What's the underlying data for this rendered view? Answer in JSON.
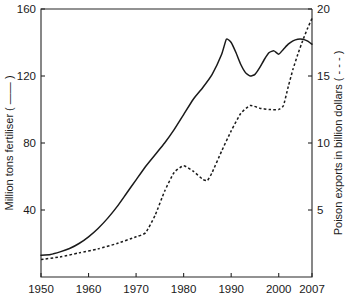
{
  "chart_data": {
    "type": "line",
    "title": "",
    "subtitle": "",
    "xlabel": "",
    "ylabel": "Million tons fertiliser ( —— )",
    "y2label": "Poison exports in billion dollars ( - - - )",
    "xlim": [
      1950,
      2007
    ],
    "ylim": [
      0,
      160
    ],
    "y2lim": [
      0,
      20
    ],
    "grid": false,
    "legend_position": "none",
    "xticks": [
      1950,
      1960,
      1970,
      1980,
      1990,
      2000,
      2007
    ],
    "xtick_labels": [
      "1950",
      "1960",
      "1970",
      "1980",
      "1990",
      "2000",
      "2007"
    ],
    "yticks": [
      40,
      80,
      120,
      160
    ],
    "ytick_labels": [
      "40",
      "80",
      "120",
      "160"
    ],
    "y2ticks": [
      5,
      10,
      15,
      20
    ],
    "y2tick_labels": [
      "5",
      "10",
      "15",
      "20"
    ],
    "series": [
      {
        "name": "Million tons fertiliser",
        "axis": "left",
        "style": "solid",
        "color": "#1a1a1a",
        "x": [
          1950,
          1952,
          1954,
          1956,
          1958,
          1960,
          1962,
          1964,
          1966,
          1968,
          1970,
          1972,
          1974,
          1976,
          1978,
          1980,
          1982,
          1984,
          1986,
          1988,
          1989,
          1990,
          1991,
          1992,
          1993,
          1994,
          1995,
          1996,
          1997,
          1998,
          1999,
          2000,
          2001,
          2002,
          2003,
          2004,
          2005,
          2006,
          2007
        ],
        "values": [
          13,
          13.5,
          15,
          17,
          20,
          24,
          29,
          35,
          42,
          50,
          58,
          66,
          73,
          80,
          88,
          97,
          106,
          113,
          121,
          133,
          142,
          140,
          134,
          127,
          122,
          120,
          121,
          125,
          130,
          134,
          135,
          133,
          136,
          139,
          141,
          142,
          142,
          141,
          139
        ]
      },
      {
        "name": "Poison exports in billion dollars",
        "axis": "right",
        "style": "dashed",
        "color": "#1a1a1a",
        "x": [
          1950,
          1954,
          1958,
          1962,
          1966,
          1970,
          1972,
          1974,
          1976,
          1978,
          1980,
          1982,
          1984,
          1985,
          1986,
          1988,
          1990,
          1992,
          1994,
          1996,
          1998,
          2000,
          2001,
          2002,
          2003,
          2004,
          2005,
          2006,
          2007
        ],
        "values": [
          1.3,
          1.5,
          1.8,
          2.1,
          2.5,
          3.0,
          3.3,
          4.6,
          6.4,
          7.8,
          8.3,
          7.9,
          7.3,
          7.2,
          7.8,
          9.4,
          10.9,
          12.2,
          12.8,
          12.6,
          12.5,
          12.5,
          12.8,
          14.2,
          15.5,
          16.6,
          17.6,
          18.5,
          19.3
        ]
      }
    ]
  },
  "axes": {
    "left_title": "Million tons fertiliser ( —— )",
    "right_title": "Poison exports in billion dollars ( - - - )"
  }
}
